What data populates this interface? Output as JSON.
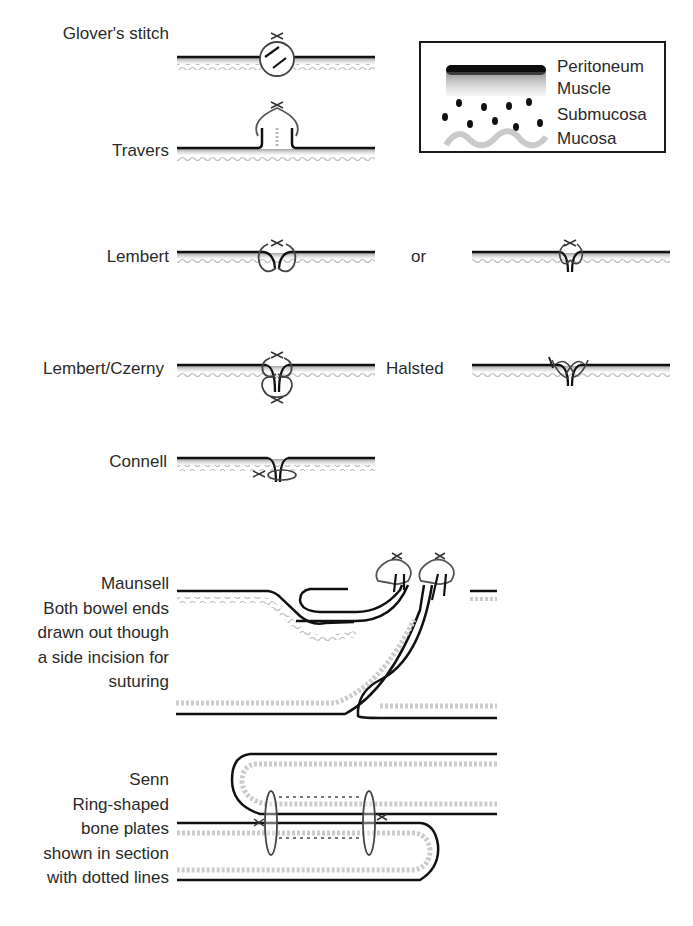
{
  "legend": {
    "items": [
      {
        "label": "Peritoneum",
        "symbol": "thick-black-bar"
      },
      {
        "label": "Muscle",
        "symbol": "gray-gradient-band"
      },
      {
        "label": "Submucosa",
        "symbol": "black-dots"
      },
      {
        "label": "Mucosa",
        "symbol": "gray-wavy-line"
      }
    ]
  },
  "techniques": [
    {
      "name": "Glover's stitch",
      "description": ""
    },
    {
      "name": "Travers",
      "description": ""
    },
    {
      "name": "Lembert",
      "description": ""
    },
    {
      "name": "Lembert/Czerny",
      "description": ""
    },
    {
      "name": "Halsted",
      "description": ""
    },
    {
      "name": "Connell",
      "description": ""
    },
    {
      "name": "Maunsell",
      "description_lines": [
        "Both bowel ends",
        "drawn out though",
        "a side incision for",
        "suturing"
      ]
    },
    {
      "name": "Senn",
      "description_lines": [
        "Ring-shaped",
        "bone plates",
        "shown in section",
        "with dotted lines"
      ]
    }
  ],
  "connectors": {
    "or": "or"
  },
  "colors": {
    "peritoneum": "#111111",
    "muscle": "#9a9a9a",
    "mucosa": "#c8c8c8",
    "background": "#ffffff"
  }
}
